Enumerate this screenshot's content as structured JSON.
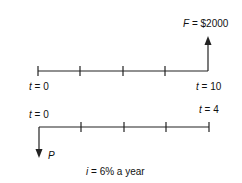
{
  "diagrams": [
    {
      "name": "future-value-timeline",
      "start_label": {
        "var": "t",
        "text": " = 0"
      },
      "end_label": {
        "var": "t",
        "text": " = 10"
      },
      "cashflow": {
        "var": "F",
        "text": " = $2000",
        "direction": "up",
        "at": "end"
      },
      "ticks": 5
    },
    {
      "name": "present-value-timeline",
      "start_label": {
        "var": "t",
        "text": " = 0"
      },
      "end_label": {
        "var": "t",
        "text": " = 4"
      },
      "cashflow": {
        "var": "P",
        "text": "",
        "direction": "down",
        "at": "start"
      },
      "ticks": 5
    }
  ],
  "interest": {
    "var": "i",
    "text": " = 6% a year"
  }
}
